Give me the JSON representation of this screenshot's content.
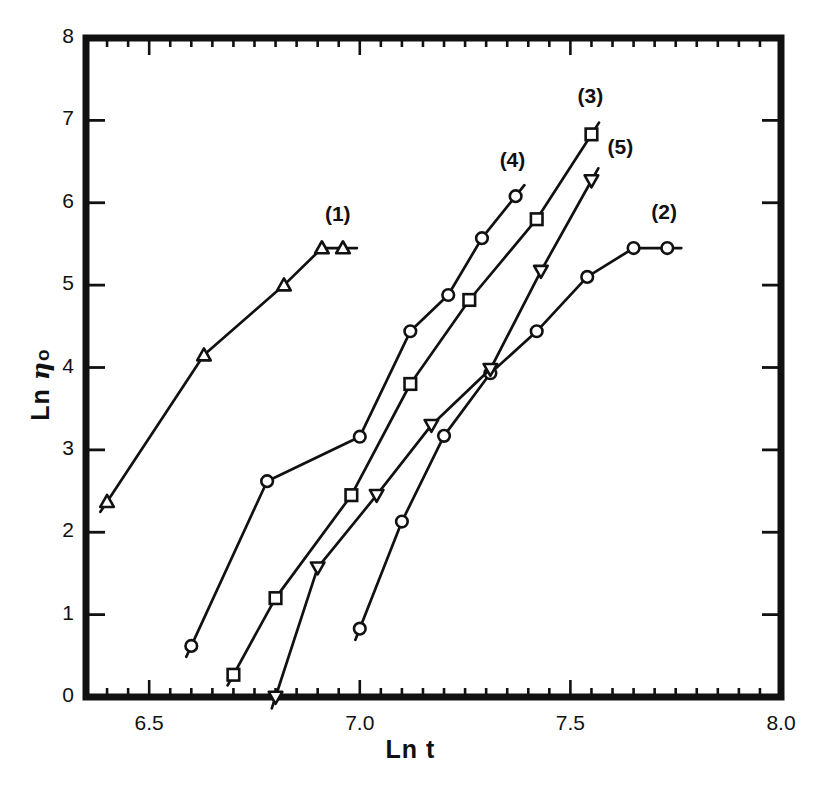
{
  "axes": {
    "xlabel": "Ln t",
    "ylabel_prefix": "Ln ",
    "ylabel_symbol": "η",
    "ylabel_sub": "o",
    "xticks": [
      "6.5",
      "7.0",
      "7.5",
      "8.0"
    ],
    "yticks": [
      "0",
      "1",
      "2",
      "3",
      "4",
      "5",
      "6",
      "7",
      "8"
    ]
  },
  "labels": {
    "c1": "(1)",
    "c2": "(2)",
    "c3": "(3)",
    "c4": "(4)",
    "c5": "(5)"
  },
  "chart_data": {
    "type": "line",
    "title": "",
    "xlabel": "Ln t",
    "ylabel": "Ln ηo",
    "xlim": [
      6.35,
      8.0
    ],
    "ylim": [
      0,
      8
    ],
    "xticks": [
      6.5,
      7.0,
      7.5,
      8.0
    ],
    "yticks": [
      0,
      1,
      2,
      3,
      4,
      5,
      6,
      7,
      8
    ],
    "minor_tick_step_x": 0.05,
    "grid": false,
    "legend": "inline-curve-labels",
    "series": [
      {
        "name": "(1)",
        "marker": "triangle-up",
        "x": [
          6.4,
          6.63,
          6.82,
          6.91,
          6.96
        ],
        "y": [
          2.37,
          4.15,
          5.0,
          5.45,
          5.45
        ]
      },
      {
        "name": "(2)",
        "marker": "circle",
        "x": [
          7.0,
          7.1,
          7.2,
          7.31,
          7.42,
          7.54,
          7.65,
          7.73
        ],
        "y": [
          0.83,
          2.13,
          3.17,
          3.93,
          4.44,
          5.1,
          5.45,
          5.45
        ]
      },
      {
        "name": "(3)",
        "marker": "square",
        "x": [
          6.7,
          6.8,
          6.98,
          7.12,
          7.26,
          7.42,
          7.55
        ],
        "y": [
          0.27,
          1.2,
          2.45,
          3.8,
          4.82,
          5.8,
          6.83
        ]
      },
      {
        "name": "(4)",
        "marker": "circle",
        "x": [
          6.6,
          6.78,
          7.0,
          7.12,
          7.21,
          7.29,
          7.37
        ],
        "y": [
          0.62,
          2.62,
          3.16,
          4.44,
          4.88,
          5.57,
          6.08
        ]
      },
      {
        "name": "(5)",
        "marker": "triangle-down",
        "x": [
          6.8,
          6.9,
          7.04,
          7.17,
          7.31,
          7.43,
          7.55
        ],
        "y": [
          0.0,
          1.57,
          2.45,
          3.3,
          3.98,
          5.17,
          6.27
        ]
      }
    ]
  }
}
